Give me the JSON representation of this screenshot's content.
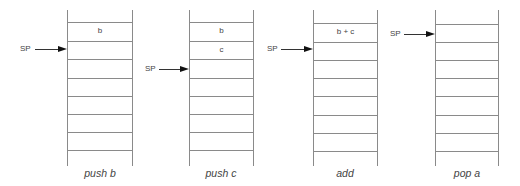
{
  "diagram": {
    "title": "",
    "line_color": "#8a8a8a",
    "text_color": "#444444",
    "stacks": [
      {
        "id": "push-b",
        "caption": "push b",
        "left": 67,
        "width": 66,
        "cells": [
          "b",
          "",
          "",
          "",
          "",
          "",
          ""
        ],
        "sp": {
          "label": "SP",
          "x": 20,
          "y": 44,
          "points_to_cell": 1
        }
      },
      {
        "id": "push-c",
        "caption": "push c",
        "left": 189,
        "width": 65,
        "cells": [
          "b",
          "c",
          "",
          "",
          "",
          "",
          ""
        ],
        "sp": {
          "label": "SP",
          "x": 145,
          "y": 64,
          "points_to_cell": 2
        }
      },
      {
        "id": "add",
        "caption": "add",
        "left": 313,
        "width": 65,
        "cells": [
          "b + c",
          "",
          "",
          "",
          "",
          "",
          ""
        ],
        "sp": {
          "label": "SP",
          "x": 267,
          "y": 44,
          "points_to_cell": 1
        }
      },
      {
        "id": "pop-a",
        "caption": "pop a",
        "left": 435,
        "width": 64,
        "cells": [
          "",
          "",
          "",
          "",
          "",
          "",
          ""
        ],
        "sp": {
          "label": "SP",
          "x": 390,
          "y": 29,
          "points_to_cell": 0
        }
      }
    ]
  }
}
